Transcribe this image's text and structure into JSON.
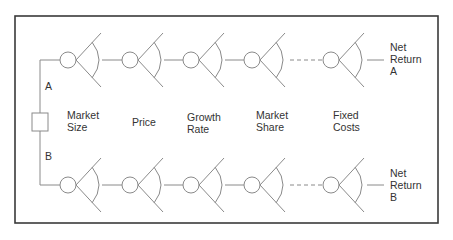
{
  "diagram": {
    "type": "decision-tree",
    "colors": {
      "line": "#8a8a8a",
      "frame": "#3a3a3a",
      "text": "#333333"
    },
    "decision_node": {
      "shape": "square"
    },
    "branches": [
      {
        "id": "A",
        "label": "A",
        "outcome": "Net\nReturn\nA"
      },
      {
        "id": "B",
        "label": "B",
        "outcome": "Net\nReturn\nB"
      }
    ],
    "stages": [
      {
        "label": "Market\nSize"
      },
      {
        "label": "Price"
      },
      {
        "label": "Growth\nRate"
      },
      {
        "label": "Market\nShare"
      },
      {
        "label": "Fixed\nCosts"
      }
    ],
    "ellipsis_between_stages": [
      4,
      5
    ]
  }
}
